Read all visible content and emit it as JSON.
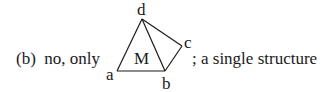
{
  "caption": {
    "prefix": "(b)  no, only",
    "suffix": "; a single structure"
  },
  "diagram": {
    "vertices": {
      "a": {
        "label": "a",
        "x": 117,
        "y": 71
      },
      "b": {
        "label": "b",
        "x": 165,
        "y": 71
      },
      "c": {
        "label": "c",
        "x": 182,
        "y": 46
      },
      "d": {
        "label": "d",
        "x": 142,
        "y": 19
      }
    },
    "region_label": "M",
    "edges": [
      [
        "a",
        "d"
      ],
      [
        "a",
        "b"
      ],
      [
        "d",
        "b"
      ],
      [
        "d",
        "c"
      ],
      [
        "c",
        "b"
      ]
    ]
  },
  "colors": {
    "ink": "#1a1a1a",
    "background": "#ffffff"
  }
}
